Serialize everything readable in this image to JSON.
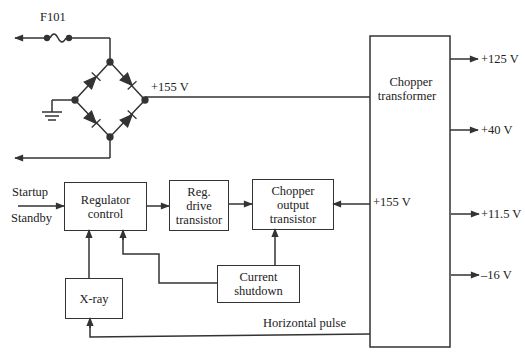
{
  "diagram": {
    "fuse_label": "F101",
    "bridge_output_label": "+155 V",
    "inputs": {
      "startup": "Startup",
      "standby": "Standby"
    },
    "blocks": {
      "regulator_control": [
        "Regulator",
        "control"
      ],
      "reg_drive": [
        "Reg.",
        "drive",
        "transistor"
      ],
      "chopper_output": [
        "Chopper",
        "output",
        "transistor"
      ],
      "chopper_transformer": [
        "Chopper",
        "transformer"
      ],
      "current_shutdown": [
        "Current",
        "shutdown"
      ],
      "xray": [
        "X-ray"
      ]
    },
    "transformer_input_label": "+155 V",
    "horizontal_pulse_label": "Horizontal pulse",
    "outputs": [
      {
        "label": "+125 V"
      },
      {
        "label": "+40 V"
      },
      {
        "label": "+11.5 V"
      },
      {
        "label": "–16 V"
      }
    ],
    "colors": {
      "line": "#333333",
      "background": "#ffffff"
    }
  }
}
